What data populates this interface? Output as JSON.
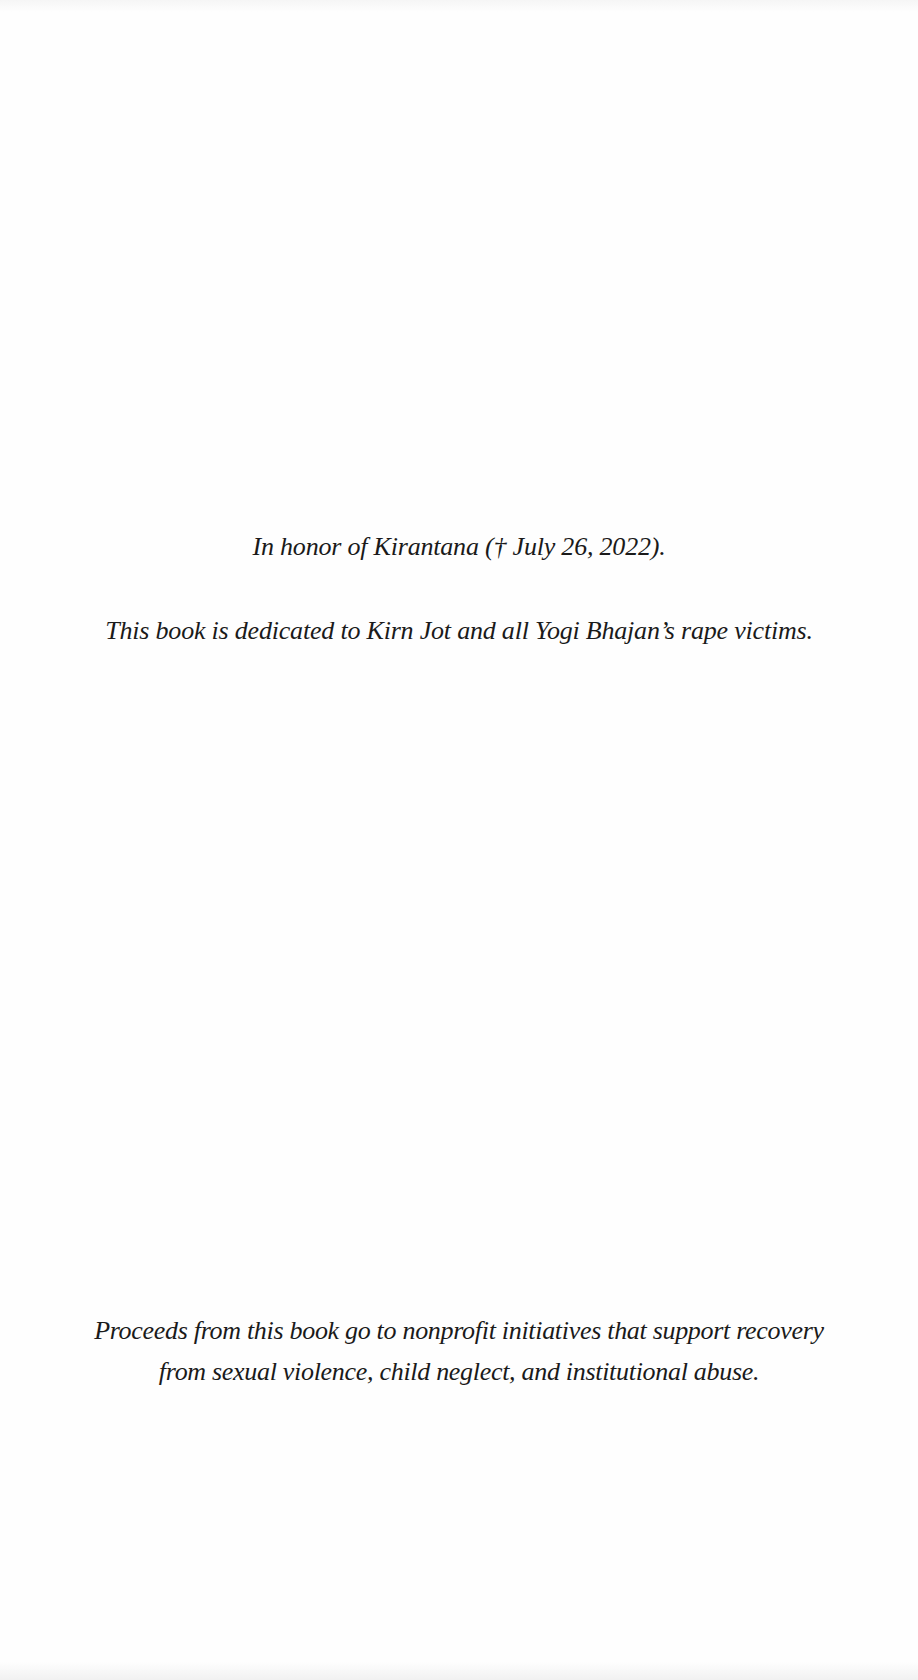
{
  "page": {
    "type": "dedication-page",
    "background_color": "#fefefe",
    "text_color": "#1a1a1a"
  },
  "honor": {
    "text": "In honor of Kirantana († July 26, 2022)."
  },
  "dedication": {
    "text": "This book is dedicated to Kirn Jot and all Yogi Bhajan’s rape victims."
  },
  "proceeds": {
    "lines": [
      "Proceeds from this book go to nonprofit initiatives that support recovery",
      "from sexual violence, child neglect, and institutional abuse."
    ]
  }
}
